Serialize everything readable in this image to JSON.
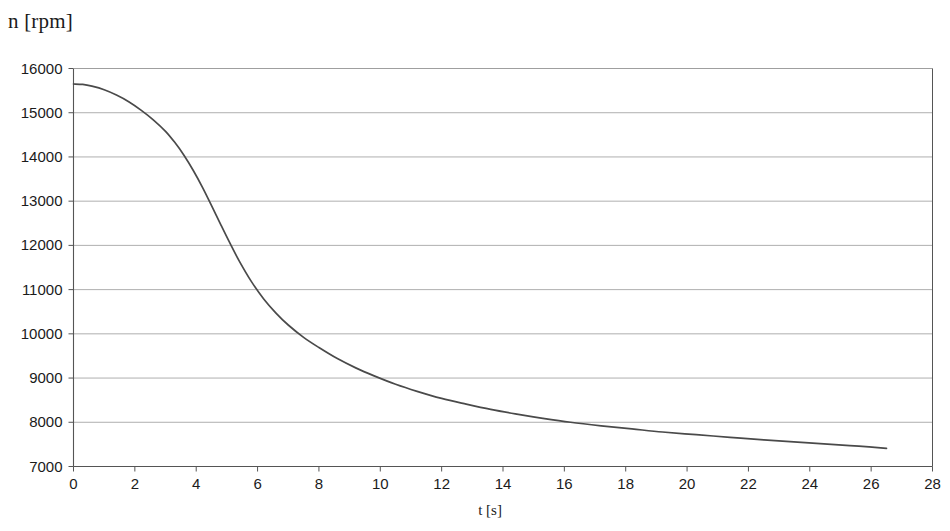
{
  "chart_data": {
    "type": "line",
    "title": "",
    "ylabel": "n [rpm]",
    "xlabel": "t [s]",
    "xlim": [
      0,
      28
    ],
    "ylim": [
      7000,
      16000
    ],
    "xticks": [
      0,
      2,
      4,
      6,
      8,
      10,
      12,
      14,
      16,
      18,
      20,
      22,
      24,
      26,
      28
    ],
    "yticks": [
      7000,
      8000,
      9000,
      10000,
      11000,
      12000,
      13000,
      14000,
      15000,
      16000
    ],
    "xtick_labels": [
      "0",
      "2",
      "4",
      "6",
      "8",
      "10",
      "12",
      "14",
      "16",
      "18",
      "20",
      "22",
      "24",
      "26",
      "28"
    ],
    "ytick_labels": [
      "7000",
      "8000",
      "9000",
      "10000",
      "11000",
      "12000",
      "13000",
      "14000",
      "15000",
      "16000"
    ],
    "grid": "horizontal",
    "legend": null,
    "series": [
      {
        "name": "n(t)",
        "color": "#4a4a4a",
        "line_width": 1.7,
        "x": [
          0.0,
          0.3,
          0.6,
          1.0,
          1.4,
          1.8,
          2.2,
          2.6,
          3.0,
          3.3,
          3.6,
          3.9,
          4.2,
          4.5,
          4.8,
          5.1,
          5.4,
          5.8,
          6.2,
          6.6,
          7.0,
          7.5,
          8.0,
          8.6,
          9.2,
          9.8,
          10.5,
          11.2,
          12.0,
          12.8,
          13.6,
          14.4,
          15.3,
          16.2,
          17.2,
          18.2,
          19.2,
          20.3,
          21.4,
          22.5,
          23.6,
          24.7,
          25.6,
          26.5
        ],
        "y": [
          15650,
          15640,
          15600,
          15520,
          15400,
          15250,
          15060,
          14840,
          14580,
          14330,
          14040,
          13700,
          13320,
          12900,
          12470,
          12050,
          11650,
          11180,
          10790,
          10470,
          10200,
          9920,
          9690,
          9440,
          9230,
          9050,
          8860,
          8700,
          8540,
          8410,
          8290,
          8190,
          8090,
          8000,
          7920,
          7850,
          7780,
          7720,
          7660,
          7600,
          7550,
          7500,
          7460,
          7410
        ]
      }
    ],
    "axis_color": "#555555",
    "grid_color": "#9a9a9a",
    "background": "#ffffff"
  },
  "figure": {
    "ylabel_text": "n [rpm]",
    "xlabel_text": "t [s]"
  }
}
